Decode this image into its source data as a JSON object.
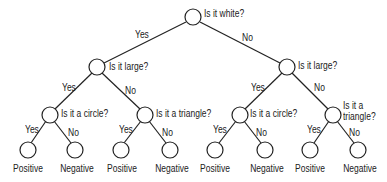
{
  "diagram": {
    "type": "decision-tree",
    "stroke_color": "#222222",
    "nodes": [
      {
        "id": "root",
        "question": "Is it white?",
        "x": 193,
        "y": 18
      },
      {
        "id": "L",
        "question": "Is it large?",
        "x": 97,
        "y": 67
      },
      {
        "id": "R",
        "question": "Is it large?",
        "x": 287,
        "y": 67
      },
      {
        "id": "LL",
        "question": "Is it a circle?",
        "x": 50,
        "y": 115
      },
      {
        "id": "LR",
        "question": "Is it a triangle?",
        "x": 145,
        "y": 115
      },
      {
        "id": "RL",
        "question": "Is it a circle?",
        "x": 240,
        "y": 115
      },
      {
        "id": "RR",
        "question_line1": "Is it a",
        "question_line2": "triangle?",
        "x": 333,
        "y": 115
      }
    ],
    "leaves": [
      {
        "label": "Positive",
        "x": 27,
        "y": 155
      },
      {
        "label": "Negative",
        "x": 75,
        "y": 155
      },
      {
        "label": "Positive",
        "x": 120,
        "y": 155
      },
      {
        "label": "Negative",
        "x": 170,
        "y": 155
      },
      {
        "label": "Positive",
        "x": 215,
        "y": 155
      },
      {
        "label": "Negative",
        "x": 265,
        "y": 155
      },
      {
        "label": "Positive",
        "x": 310,
        "y": 155
      },
      {
        "label": "Negative",
        "x": 358,
        "y": 155
      }
    ],
    "edges": [
      {
        "from": "root",
        "to": "L",
        "label": "Yes"
      },
      {
        "from": "root",
        "to": "R",
        "label": "No"
      },
      {
        "from": "L",
        "to": "LL",
        "label": "Yes"
      },
      {
        "from": "L",
        "to": "LR",
        "label": "No"
      },
      {
        "from": "R",
        "to": "RL",
        "label": "Yes"
      },
      {
        "from": "R",
        "to": "RR",
        "label": "No"
      },
      {
        "from": "LL",
        "to": "leaf0",
        "label": "Yes"
      },
      {
        "from": "LL",
        "to": "leaf1",
        "label": "No"
      },
      {
        "from": "LR",
        "to": "leaf2",
        "label": "Yes"
      },
      {
        "from": "LR",
        "to": "leaf3",
        "label": "No"
      },
      {
        "from": "RL",
        "to": "leaf4",
        "label": "Yes"
      },
      {
        "from": "RL",
        "to": "leaf5",
        "label": "No"
      },
      {
        "from": "RR",
        "to": "leaf6",
        "label": "Yes"
      },
      {
        "from": "RR",
        "to": "leaf7",
        "label": "No"
      }
    ]
  }
}
